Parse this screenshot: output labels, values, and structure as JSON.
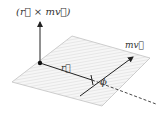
{
  "diagram": {
    "type": "vector-diagram",
    "labels": {
      "angular_momentum": "(r⃗ × mv⃗)",
      "momentum": "mv⃗",
      "position": "r⃗",
      "angle": "ϕ"
    },
    "elements": [
      "plane",
      "origin-point",
      "angular-momentum-axis",
      "position-vector",
      "momentum-vector",
      "dashed-extension"
    ],
    "colors": {
      "stroke": "#222222",
      "plane_fill": "#f4f4f4",
      "plane_hatch": "#d8d8d8",
      "plane_edge": "#bbbbbb"
    }
  }
}
